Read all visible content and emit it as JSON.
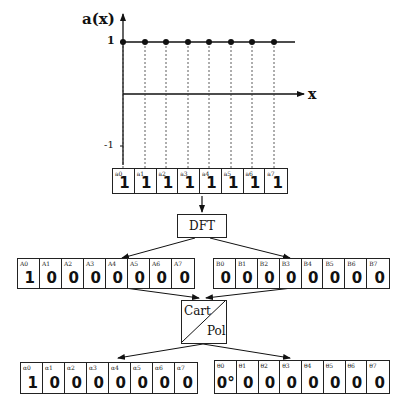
{
  "plot": {
    "y_label": "a(x)",
    "x_label": "x",
    "tick_pos": "1",
    "tick_neg": "-1",
    "samples": [
      1,
      1,
      1,
      1,
      1,
      1,
      1,
      1
    ]
  },
  "arrays": {
    "a": {
      "subs": [
        "a0",
        "a1",
        "a2",
        "a3",
        "a4",
        "a5",
        "a6",
        "a7"
      ],
      "values": [
        "1",
        "1",
        "1",
        "1",
        "1",
        "1",
        "1",
        "1"
      ]
    },
    "A": {
      "subs": [
        "A0",
        "A1",
        "A2",
        "A3",
        "A4",
        "A5",
        "A6",
        "A7"
      ],
      "values": [
        "1",
        "0",
        "0",
        "0",
        "0",
        "0",
        "0",
        "0"
      ]
    },
    "B": {
      "subs": [
        "B0",
        "B1",
        "B2",
        "B3",
        "B4",
        "B5",
        "B6",
        "B7"
      ],
      "values": [
        "0",
        "0",
        "0",
        "0",
        "0",
        "0",
        "0",
        "0"
      ]
    },
    "alpha": {
      "subs": [
        "α0",
        "α1",
        "α2",
        "α3",
        "α4",
        "α5",
        "α6",
        "α7"
      ],
      "values": [
        "1",
        "0",
        "0",
        "0",
        "0",
        "0",
        "0",
        "0"
      ]
    },
    "theta": {
      "subs": [
        "θ0",
        "θ1",
        "θ2",
        "θ3",
        "θ4",
        "θ5",
        "θ6",
        "θ7"
      ],
      "values": [
        "0°",
        "0",
        "0",
        "0",
        "0",
        "0",
        "0",
        "0"
      ]
    }
  },
  "blocks": {
    "dft": "DFT",
    "cart": "Cart",
    "pol": "Pol"
  }
}
